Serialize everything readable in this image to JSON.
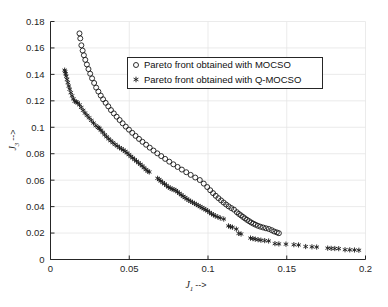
{
  "figure": {
    "background_color": "#ffffff",
    "axis_color": "#262626",
    "grid_color": "#e6e6e6",
    "marker_color": "#1a1a1a"
  },
  "axes": {
    "x": {
      "title_symbol": "J",
      "title_subscript": "1",
      "title_arrow": "-->",
      "title_full": "J1 -->",
      "ticks": [
        "0",
        "0.05",
        "0.1",
        "0.15",
        "0.2"
      ],
      "tick_values": [
        0,
        0.05,
        0.1,
        0.15,
        0.2
      ],
      "min": 0,
      "max": 0.2
    },
    "y": {
      "title_symbol": "J",
      "title_subscript": "3",
      "title_arrow": "-->",
      "title_full": "J3 -->",
      "ticks": [
        "0",
        "0.02",
        "0.04",
        "0.06",
        "0.08",
        "0.1",
        "0.12",
        "0.14",
        "0.16",
        "0.18"
      ],
      "tick_values": [
        0,
        0.02,
        0.04,
        0.06,
        0.08,
        0.1,
        0.12,
        0.14,
        0.16,
        0.18
      ],
      "min": 0,
      "max": 0.18
    }
  },
  "legend": {
    "position": "upper-center",
    "entries": [
      {
        "marker": "circle",
        "label": "Pareto front obtained with MOCSO"
      },
      {
        "marker": "star",
        "label": "Pareto front obtained with Q-MOCSO"
      }
    ]
  },
  "chart_data": {
    "type": "scatter",
    "title": "",
    "subtitle": "",
    "xlabel": "J1 -->",
    "ylabel": "J3 -->",
    "xlim": [
      0,
      0.2
    ],
    "ylim": [
      0,
      0.18
    ],
    "xticks": [
      0,
      0.05,
      0.1,
      0.15,
      0.2
    ],
    "yticks": [
      0,
      0.02,
      0.04,
      0.06,
      0.08,
      0.1,
      0.12,
      0.14,
      0.16,
      0.18
    ],
    "grid": true,
    "legend_position": "upper center",
    "series": [
      {
        "name": "Pareto front obtained with MOCSO",
        "marker": "circle",
        "points": [
          [
            0.0184,
            0.171
          ],
          [
            0.0189,
            0.1672
          ],
          [
            0.0196,
            0.162
          ],
          [
            0.0204,
            0.158
          ],
          [
            0.0212,
            0.1545
          ],
          [
            0.0221,
            0.151
          ],
          [
            0.0231,
            0.1475
          ],
          [
            0.0241,
            0.144
          ],
          [
            0.0252,
            0.1405
          ],
          [
            0.0264,
            0.137
          ],
          [
            0.0277,
            0.1335
          ],
          [
            0.029,
            0.13
          ],
          [
            0.0304,
            0.127
          ],
          [
            0.0319,
            0.124
          ],
          [
            0.0334,
            0.1212
          ],
          [
            0.035,
            0.1185
          ],
          [
            0.0367,
            0.1158
          ],
          [
            0.0384,
            0.113
          ],
          [
            0.0402,
            0.1105
          ],
          [
            0.042,
            0.108
          ],
          [
            0.0439,
            0.1055
          ],
          [
            0.0458,
            0.103
          ],
          [
            0.0478,
            0.1005
          ],
          [
            0.0498,
            0.0982
          ],
          [
            0.0519,
            0.0958
          ],
          [
            0.054,
            0.0935
          ],
          [
            0.0562,
            0.0912
          ],
          [
            0.0584,
            0.089
          ],
          [
            0.0607,
            0.0868
          ],
          [
            0.063,
            0.0846
          ],
          [
            0.0654,
            0.0824
          ],
          [
            0.0678,
            0.0803
          ],
          [
            0.0703,
            0.0782
          ],
          [
            0.0728,
            0.0761
          ],
          [
            0.0754,
            0.074
          ],
          [
            0.078,
            0.072
          ],
          [
            0.0807,
            0.07
          ],
          [
            0.0834,
            0.068
          ],
          [
            0.0862,
            0.066
          ],
          [
            0.089,
            0.064
          ],
          [
            0.0919,
            0.062
          ],
          [
            0.0948,
            0.0601
          ],
          [
            0.0973,
            0.0574
          ],
          [
            0.0995,
            0.0548
          ],
          [
            0.1014,
            0.0524
          ],
          [
            0.1032,
            0.0502
          ],
          [
            0.1049,
            0.0482
          ],
          [
            0.1066,
            0.0464
          ],
          [
            0.1083,
            0.0447
          ],
          [
            0.1099,
            0.0431
          ],
          [
            0.1115,
            0.0416
          ],
          [
            0.1131,
            0.0402
          ],
          [
            0.1148,
            0.0389
          ],
          [
            0.1165,
            0.0377
          ],
          [
            0.1183,
            0.0358
          ],
          [
            0.1196,
            0.0345
          ],
          [
            0.1209,
            0.0334
          ],
          [
            0.1222,
            0.0322
          ],
          [
            0.1235,
            0.0311
          ],
          [
            0.1248,
            0.03
          ],
          [
            0.1261,
            0.029
          ],
          [
            0.1274,
            0.028
          ],
          [
            0.1288,
            0.0271
          ],
          [
            0.1302,
            0.0263
          ],
          [
            0.1317,
            0.0255
          ],
          [
            0.1333,
            0.0248
          ],
          [
            0.135,
            0.0242
          ],
          [
            0.1368,
            0.0236
          ],
          [
            0.1386,
            0.0231
          ],
          [
            0.1404,
            0.0222
          ],
          [
            0.142,
            0.0212
          ],
          [
            0.1437,
            0.0205
          ],
          [
            0.145,
            0.0199
          ]
        ]
      },
      {
        "name": "Pareto front obtained with Q-MOCSO",
        "marker": "star",
        "points": [
          [
            0.009,
            0.1432
          ],
          [
            0.0093,
            0.142
          ],
          [
            0.0096,
            0.1405
          ],
          [
            0.01,
            0.1386
          ],
          [
            0.0105,
            0.1362
          ],
          [
            0.011,
            0.1338
          ],
          [
            0.0116,
            0.1312
          ],
          [
            0.0122,
            0.1288
          ],
          [
            0.0129,
            0.1262
          ],
          [
            0.0137,
            0.1238
          ],
          [
            0.0145,
            0.1215
          ],
          [
            0.0154,
            0.1197
          ],
          [
            0.0163,
            0.1192
          ],
          [
            0.0173,
            0.1185
          ],
          [
            0.0184,
            0.117
          ],
          [
            0.0195,
            0.115
          ],
          [
            0.0207,
            0.1128
          ],
          [
            0.0219,
            0.1108
          ],
          [
            0.0232,
            0.109
          ],
          [
            0.0245,
            0.1072
          ],
          [
            0.0259,
            0.1052
          ],
          [
            0.0273,
            0.1032
          ],
          [
            0.0288,
            0.1012
          ],
          [
            0.0303,
            0.0998
          ],
          [
            0.031,
            0.0992
          ],
          [
            0.032,
            0.0978
          ],
          [
            0.0332,
            0.0962
          ],
          [
            0.0344,
            0.0944
          ],
          [
            0.0357,
            0.0928
          ],
          [
            0.037,
            0.0912
          ],
          [
            0.0383,
            0.0898
          ],
          [
            0.0396,
            0.0884
          ],
          [
            0.041,
            0.087
          ],
          [
            0.0424,
            0.0858
          ],
          [
            0.0438,
            0.0846
          ],
          [
            0.045,
            0.0838
          ],
          [
            0.0462,
            0.0828
          ],
          [
            0.0474,
            0.0818
          ],
          [
            0.0486,
            0.0806
          ],
          [
            0.0498,
            0.0793
          ],
          [
            0.051,
            0.078
          ],
          [
            0.0522,
            0.0768
          ],
          [
            0.0534,
            0.0756
          ],
          [
            0.0546,
            0.0744
          ],
          [
            0.0558,
            0.0732
          ],
          [
            0.057,
            0.072
          ],
          [
            0.0582,
            0.0708
          ],
          [
            0.0594,
            0.0694
          ],
          [
            0.0606,
            0.068
          ],
          [
            0.0618,
            0.0668
          ],
          [
            0.0627,
            0.0662
          ],
          [
            0.068,
            0.0614
          ],
          [
            0.069,
            0.0604
          ],
          [
            0.07,
            0.0594
          ],
          [
            0.0712,
            0.0582
          ],
          [
            0.0724,
            0.0572
          ],
          [
            0.0736,
            0.056
          ],
          [
            0.0748,
            0.0548
          ],
          [
            0.076,
            0.054
          ],
          [
            0.0772,
            0.0533
          ],
          [
            0.0784,
            0.0528
          ],
          [
            0.0796,
            0.0522
          ],
          [
            0.0806,
            0.0512
          ],
          [
            0.0818,
            0.05
          ],
          [
            0.083,
            0.0489
          ],
          [
            0.0842,
            0.0478
          ],
          [
            0.0854,
            0.0468
          ],
          [
            0.0866,
            0.0458
          ],
          [
            0.0878,
            0.0448
          ],
          [
            0.089,
            0.044
          ],
          [
            0.0902,
            0.0432
          ],
          [
            0.0914,
            0.0424
          ],
          [
            0.0926,
            0.0416
          ],
          [
            0.0938,
            0.0408
          ],
          [
            0.095,
            0.04
          ],
          [
            0.0962,
            0.0392
          ],
          [
            0.0974,
            0.0384
          ],
          [
            0.0986,
            0.0376
          ],
          [
            0.0998,
            0.0368
          ],
          [
            0.101,
            0.0356
          ],
          [
            0.1022,
            0.0346
          ],
          [
            0.1034,
            0.0338
          ],
          [
            0.1046,
            0.033
          ],
          [
            0.1062,
            0.0322
          ],
          [
            0.1078,
            0.0314
          ],
          [
            0.11,
            0.0306
          ],
          [
            0.113,
            0.0254
          ],
          [
            0.1142,
            0.0248
          ],
          [
            0.1155,
            0.0244
          ],
          [
            0.118,
            0.023
          ],
          [
            0.1195,
            0.0197
          ],
          [
            0.121,
            0.0193
          ],
          [
            0.127,
            0.0162
          ],
          [
            0.1285,
            0.0158
          ],
          [
            0.13,
            0.0154
          ],
          [
            0.1318,
            0.015
          ],
          [
            0.1336,
            0.0146
          ],
          [
            0.136,
            0.0143
          ],
          [
            0.1385,
            0.014
          ],
          [
            0.1425,
            0.012
          ],
          [
            0.145,
            0.0118
          ],
          [
            0.1495,
            0.0116
          ],
          [
            0.1545,
            0.0112
          ],
          [
            0.1575,
            0.011
          ],
          [
            0.162,
            0.0098
          ],
          [
            0.166,
            0.0096
          ],
          [
            0.169,
            0.0094
          ],
          [
            0.176,
            0.0086
          ],
          [
            0.1782,
            0.0084
          ],
          [
            0.1805,
            0.0083
          ],
          [
            0.183,
            0.0082
          ],
          [
            0.187,
            0.0074
          ],
          [
            0.19,
            0.0073
          ],
          [
            0.193,
            0.0072
          ],
          [
            0.1958,
            0.007
          ]
        ]
      }
    ]
  }
}
